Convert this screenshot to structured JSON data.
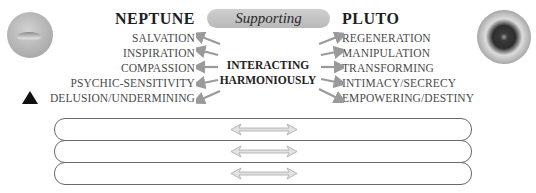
{
  "header": {
    "left_planet": "NEPTUNE",
    "right_planet": "PLUTO",
    "relationship": "Supporting"
  },
  "neptune": {
    "traits": [
      "SALVATION",
      "INSPIRATION",
      "COMPASSION",
      "PSYCHIC-SENSITIVITY",
      "DELUSION/UNDERMINING"
    ]
  },
  "pluto": {
    "traits": [
      "REGENERATION",
      "MANIPULATION",
      "TRANSFORMING",
      "INTIMACY/SECRECY",
      "EMPOWERING/DESTINY"
    ]
  },
  "center": {
    "line1": "INTERACTING",
    "line2": "HARMONIOUSLY"
  },
  "icons": {
    "left": "neptune-planet-icon",
    "right": "pluto-planet-icon",
    "marker": "triangle-icon",
    "row_connector": "double-arrow-icon"
  },
  "rows": [
    {
      "left": "",
      "right": ""
    },
    {
      "left": "",
      "right": ""
    },
    {
      "left": "",
      "right": ""
    }
  ],
  "colors": {
    "pill_bg": "#c4c4c4",
    "arrow": "#9a9a9a",
    "row_border": "#6a6a6a",
    "title": "#1e1e1e"
  }
}
